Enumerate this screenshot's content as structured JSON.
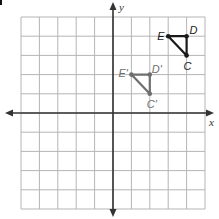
{
  "diagram": {
    "type": "coordinate-grid-translation",
    "grid": {
      "x_min": -5,
      "x_max": 5,
      "y_min": -5,
      "y_max": 5,
      "step": 1
    },
    "axes": {
      "x_label": "x",
      "y_label": "y"
    },
    "colors": {
      "grid": "#b5b5b5",
      "axis": "#333333",
      "original": "#1a1a1a",
      "image": "#6e6e6e"
    },
    "original_triangle": {
      "name": "EDC",
      "vertices": [
        {
          "label": "E",
          "x": 3,
          "y": 4
        },
        {
          "label": "D",
          "x": 4,
          "y": 4
        },
        {
          "label": "C",
          "x": 4,
          "y": 3
        }
      ]
    },
    "image_triangle": {
      "name": "E'D'C'",
      "vertices": [
        {
          "label": "E'",
          "x": 1,
          "y": 2
        },
        {
          "label": "D'",
          "x": 2,
          "y": 2
        },
        {
          "label": "C'",
          "x": 2,
          "y": 1
        }
      ]
    }
  }
}
